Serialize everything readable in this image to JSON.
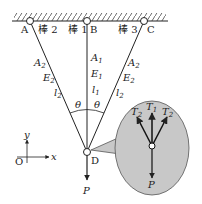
{
  "support": {
    "points": [
      "A",
      "B",
      "C"
    ],
    "hatch": true
  },
  "rods": [
    {
      "name": "棒1",
      "label": "棒 1",
      "A": "A",
      "A_sub": "1",
      "E": "E",
      "E_sub": "1",
      "l": "l",
      "l_sub": "1"
    },
    {
      "name": "棒2",
      "label": "棒 2",
      "A": "A",
      "A_sub": "2",
      "E": "E",
      "E_sub": "2",
      "l": "l",
      "l_sub": "2"
    },
    {
      "name": "棒3",
      "label": "棒 3",
      "A": "A",
      "A_sub": "2",
      "E": "E",
      "E_sub": "2",
      "l": "l",
      "l_sub": "2"
    }
  ],
  "angle": "θ",
  "joint": "D",
  "load": "P",
  "axes": {
    "origin": "O",
    "x": "x",
    "y": "y"
  },
  "inset": {
    "forces": [
      {
        "T": "T",
        "sub": "2"
      },
      {
        "T": "T",
        "sub": "1"
      },
      {
        "T": "T",
        "sub": "2"
      }
    ],
    "load": "P",
    "fill": "#c8c8c8"
  },
  "colors": {
    "line": "#222222",
    "inset_fill": "#c8c8c8"
  }
}
